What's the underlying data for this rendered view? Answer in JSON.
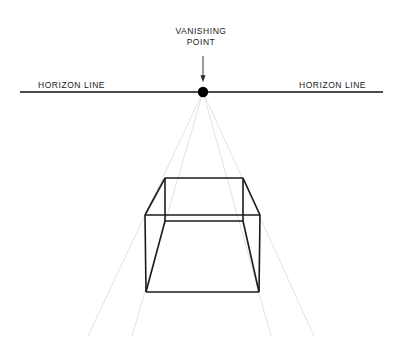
{
  "diagram": {
    "labels": {
      "vanishing_point_line1": "VANISHING",
      "vanishing_point_line2": "POINT",
      "horizon_left": "HORIZON LINE",
      "horizon_right": "HORIZON LINE"
    },
    "colors": {
      "background": "#ffffff",
      "ink": "#1a1a1a",
      "horizon_line": "#111111",
      "cube_stroke": "#1a1a1a",
      "guide_line": "#e3e3e3",
      "vanishing_point_dot": "#000000",
      "arrow": "#333333"
    }
  },
  "chart_data": {
    "type": "diagram",
    "xlabel": "",
    "ylabel": "",
    "canvas": {
      "width": 402,
      "height": 355
    },
    "vanishing_point": {
      "x": 203,
      "y": 92,
      "radius": 5.2
    },
    "horizon_line": {
      "x1": 20,
      "y1": 92,
      "x2": 383,
      "y2": 92,
      "stroke_width": 1.5
    },
    "pointer_arrow": {
      "x1": 203,
      "y1": 56,
      "x2": 203,
      "y2": 79,
      "head_width": 5,
      "head_height": 7,
      "stroke_width": 1
    },
    "cube": {
      "stroke_width": 1.6,
      "back_face": {
        "top_left": {
          "x": 165,
          "y": 178
        },
        "top_right": {
          "x": 243,
          "y": 178
        },
        "bottom_right": {
          "x": 243,
          "y": 221
        },
        "bottom_left": {
          "x": 165,
          "y": 221
        }
      },
      "front_face": {
        "top_left": {
          "x": 145,
          "y": 215
        },
        "top_right": {
          "x": 260,
          "y": 215
        },
        "bottom_right": {
          "x": 259,
          "y": 292
        },
        "bottom_left": {
          "x": 146,
          "y": 292
        }
      },
      "connectors": [
        {
          "from": "back_top_left",
          "to": "front_top_left"
        },
        {
          "from": "back_top_right",
          "to": "front_top_right"
        },
        {
          "from": "back_bottom_left",
          "to": "front_bottom_left"
        },
        {
          "from": "back_bottom_right",
          "to": "front_bottom_right"
        }
      ]
    },
    "guide_lines": {
      "stroke": "#e3e3e3",
      "stroke_width": 1,
      "origin": {
        "x": 203,
        "y": 92
      },
      "endpoints": [
        {
          "x": 88,
          "y": 336
        },
        {
          "x": 132,
          "y": 336
        },
        {
          "x": 271,
          "y": 336
        },
        {
          "x": 314,
          "y": 336
        }
      ]
    }
  }
}
